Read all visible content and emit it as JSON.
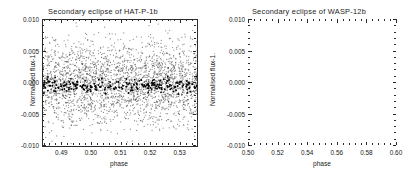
{
  "figure": {
    "background_color": "#ffffff",
    "point_color": "#111111",
    "axis_color": "#2b2b2b",
    "width": 412,
    "height": 180
  },
  "panels": [
    {
      "id": "hat-p-1b",
      "title": "Secondary eclipse of HAT-P-1b",
      "xlabel": "phase",
      "ylabel": "Normalised flux-1.",
      "xticks": [
        "0.49",
        "0.50",
        "0.51",
        "0.52",
        "0.53"
      ],
      "xtick_values": [
        0.49,
        0.5,
        0.51,
        0.52,
        0.53
      ],
      "yticks": [
        "0.010",
        "0.005",
        "0.000",
        "-0.005",
        "-0.010"
      ],
      "ytick_values": [
        0.01,
        0.005,
        0.0,
        -0.005,
        -0.01
      ]
    },
    {
      "id": "wasp-12b",
      "title": "Secondary eclipse of WASP-12b",
      "xlabel": "phase",
      "ylabel": "Normalised flux-1.",
      "xticks": [
        "0.50",
        "0.52",
        "0.54",
        "0.56",
        "0.58",
        "0.60"
      ],
      "xtick_values": [
        0.5,
        0.52,
        0.54,
        0.56,
        0.58,
        0.6
      ],
      "yticks": [
        "0.010",
        "0.005",
        "0.000",
        "-0.005",
        "-0.010"
      ],
      "ytick_values": [
        0.01,
        0.005,
        0.0,
        -0.005,
        -0.01
      ]
    }
  ],
  "chart_data": [
    {
      "type": "scatter",
      "title": "Secondary eclipse of HAT-P-1b",
      "xlabel": "phase",
      "ylabel": "Normalised flux-1.",
      "xlim": [
        0.4835,
        0.5355
      ],
      "ylim": [
        -0.01,
        0.01
      ],
      "grid": false,
      "legend": null,
      "series": [
        {
          "name": "unbinned photometry",
          "marker": "dot",
          "color": "#444444",
          "n_points": 2600,
          "x_range": [
            0.4835,
            0.5355
          ],
          "y_center": 0.0,
          "y_scatter_sigma": 0.0032,
          "description": "Dense cloud of individual photometric measurements scattered about zero, spanning nearly the full -0.009 to +0.009 vertical range with density falling off away from zero."
        },
        {
          "name": "binned photometry",
          "marker": "dot",
          "color": "#000000",
          "n_points": 210,
          "x_range": [
            0.4835,
            0.5355
          ],
          "y_center": -0.0004,
          "y_scatter_sigma": 0.00055,
          "description": "Dark concentrated horizontal band of binned points lying just below zero across the whole phase range."
        }
      ]
    },
    {
      "type": "scatter",
      "title": "Secondary eclipse of WASP-12b",
      "xlabel": "phase",
      "ylabel": "Normalised flux-1.",
      "xlim": [
        0.5,
        0.6
      ],
      "ylim": [
        -0.01,
        0.01
      ],
      "grid": false,
      "legend": null,
      "series": [
        {
          "name": "photometry",
          "marker": "dot",
          "color": "#111111",
          "n_points": 1250,
          "x_range": [
            0.5,
            0.6
          ],
          "y_center": -0.0009,
          "y_scatter_sigma": 0.0019,
          "description": "Sparser scatter concentrated between about -0.006 and +0.004, the cloud drifting slightly upward with increasing phase."
        }
      ]
    }
  ]
}
